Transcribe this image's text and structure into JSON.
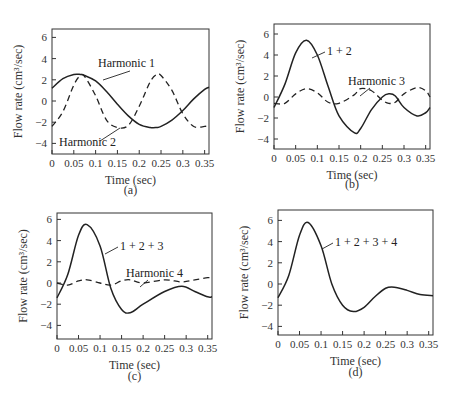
{
  "figure": {
    "panels": [
      {
        "id": "a",
        "caption": "(a)",
        "xlabel": "Time (sec)",
        "ylabel": "Flow rate (cm³/sec)",
        "annotations": [
          {
            "text": "Harmonic 1",
            "series": 0
          },
          {
            "text": "Harmonic 2",
            "series": 1
          }
        ]
      },
      {
        "id": "b",
        "caption": "(b)",
        "xlabel": "Time (sec)",
        "ylabel": "Flow rate (cm³/sec)",
        "annotations": [
          {
            "text": "1 + 2",
            "series": 0
          },
          {
            "text": "Harmonic 3",
            "series": 1
          }
        ]
      },
      {
        "id": "c",
        "caption": "(c)",
        "xlabel": "Time (sec)",
        "ylabel": "Flow rate (cm³/sec)",
        "annotations": [
          {
            "text": "1 + 2 + 3",
            "series": 0
          },
          {
            "text": "Harmonic 4",
            "series": 1
          }
        ]
      },
      {
        "id": "d",
        "caption": "(d)",
        "xlabel": "Time (sec)",
        "ylabel": "Flow rate (cm³/sec)",
        "annotations": [
          {
            "text": "1 + 2 + 3 + 4",
            "series": 0
          }
        ]
      }
    ],
    "x_ticks": [
      "0",
      "0.05",
      "0.1",
      "0.15",
      "0.2",
      "0.25",
      "0.3",
      "0.35"
    ],
    "y_ticks": [
      "6",
      "4",
      "2",
      "0",
      "−2",
      "−4"
    ]
  },
  "chart_data": [
    {
      "type": "line",
      "title": "(a)",
      "xlabel": "Time (sec)",
      "ylabel": "Flow rate (cm^3/sec)",
      "xlim": [
        0,
        0.36
      ],
      "ylim": [
        -5,
        7
      ],
      "grid": false,
      "x": [
        0,
        0.025,
        0.05,
        0.065,
        0.075,
        0.1,
        0.125,
        0.15,
        0.175,
        0.2,
        0.225,
        0.24,
        0.25,
        0.275,
        0.3,
        0.325,
        0.35,
        0.36
      ],
      "series": [
        {
          "name": "Harmonic 1",
          "style": "solid",
          "values": [
            1.2,
            2.1,
            2.5,
            2.5,
            2.4,
            1.9,
            0.9,
            -0.3,
            -1.4,
            -2.2,
            -2.5,
            -2.5,
            -2.4,
            -1.8,
            -0.9,
            0.2,
            1.1,
            1.3
          ]
        },
        {
          "name": "Harmonic 2",
          "style": "dashed",
          "values": [
            -2.4,
            -1.0,
            1.5,
            2.4,
            2.3,
            0.5,
            -1.8,
            -2.5,
            -2.3,
            -0.5,
            1.8,
            2.5,
            2.4,
            1.0,
            -1.2,
            -2.4,
            -2.4,
            -2.3
          ]
        }
      ]
    },
    {
      "type": "line",
      "title": "(b)",
      "xlabel": "Time (sec)",
      "ylabel": "Flow rate (cm^3/sec)",
      "xlim": [
        0,
        0.36
      ],
      "ylim": [
        -5,
        7
      ],
      "grid": false,
      "x": [
        0,
        0.025,
        0.05,
        0.075,
        0.1,
        0.125,
        0.15,
        0.185,
        0.2,
        0.225,
        0.25,
        0.265,
        0.28,
        0.3,
        0.33,
        0.35,
        0.36
      ],
      "series": [
        {
          "name": "1 + 2",
          "style": "solid",
          "values": [
            -1.0,
            1.2,
            4.2,
            5.4,
            4.0,
            1.0,
            -1.8,
            -3.4,
            -3.0,
            -1.2,
            0.0,
            0.3,
            0.1,
            -1.0,
            -1.8,
            -1.5,
            -1.0
          ]
        },
        {
          "name": "Harmonic 3",
          "style": "dashed",
          "values": [
            -0.6,
            -0.6,
            0.3,
            0.8,
            0.4,
            -0.5,
            -0.6,
            0.2,
            0.8,
            0.6,
            -0.3,
            -0.6,
            -0.5,
            0.3,
            0.9,
            0.6,
            0.0
          ]
        }
      ]
    },
    {
      "type": "line",
      "title": "(c)",
      "xlabel": "Time (sec)",
      "ylabel": "Flow rate (cm^3/sec)",
      "xlim": [
        0,
        0.36
      ],
      "ylim": [
        -5,
        7
      ],
      "grid": false,
      "x": [
        0,
        0.025,
        0.05,
        0.07,
        0.1,
        0.125,
        0.15,
        0.17,
        0.2,
        0.25,
        0.29,
        0.32,
        0.35,
        0.36
      ],
      "series": [
        {
          "name": "1 + 2 + 3",
          "style": "solid",
          "values": [
            -1.4,
            0.8,
            4.5,
            5.5,
            3.5,
            -0.5,
            -2.5,
            -2.8,
            -2.0,
            -0.8,
            -0.3,
            -0.8,
            -1.3,
            -1.3
          ]
        },
        {
          "name": "Harmonic 4",
          "style": "dashed",
          "values": [
            0.0,
            -0.2,
            0.2,
            0.3,
            0.0,
            -0.2,
            0.2,
            0.3,
            0.0,
            0.3,
            0.1,
            0.3,
            0.5,
            0.5
          ]
        }
      ]
    },
    {
      "type": "line",
      "title": "(d)",
      "xlabel": "Time (sec)",
      "ylabel": "Flow rate (cm^3/sec)",
      "xlim": [
        0,
        0.36
      ],
      "ylim": [
        -5,
        7
      ],
      "grid": false,
      "x": [
        0,
        0.025,
        0.05,
        0.07,
        0.1,
        0.125,
        0.15,
        0.175,
        0.2,
        0.225,
        0.25,
        0.27,
        0.3,
        0.33,
        0.36
      ],
      "series": [
        {
          "name": "1 + 2 + 3 + 4",
          "style": "solid",
          "values": [
            -1.3,
            0.8,
            4.6,
            5.8,
            3.6,
            0.0,
            -2.0,
            -2.6,
            -2.2,
            -1.2,
            -0.4,
            -0.3,
            -0.6,
            -1.0,
            -1.1
          ]
        }
      ]
    }
  ]
}
